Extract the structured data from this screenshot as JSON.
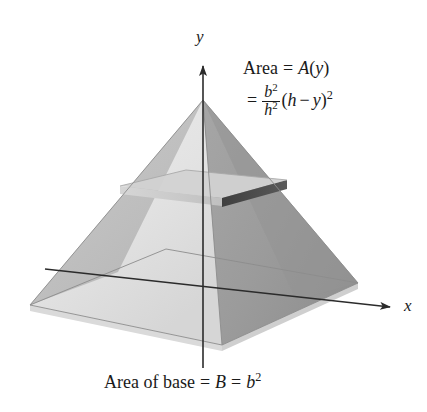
{
  "figure": {
    "axes": {
      "y_label": "y",
      "x_label": "x"
    },
    "annotation": {
      "line1_prefix": "Area",
      "line1_equals": "=",
      "line1_func_name": "A",
      "line1_open": "(",
      "line1_arg": "y",
      "line1_close": ")",
      "line2_equals": "=",
      "frac_numerator_base": "b",
      "frac_numerator_exp": "2",
      "frac_denominator_base": "h",
      "frac_denominator_exp": "2",
      "line2_open": "(",
      "line2_var_h": "h",
      "line2_minus": "−",
      "line2_var_y": "y",
      "line2_close": ")",
      "line2_exp": "2",
      "plain_line1": "Area = A(y)",
      "plain_line2": "= b²/h² (h − y)²"
    },
    "caption": {
      "text_prefix": "Area of base",
      "equals_1": "=",
      "symbol_B": "B",
      "equals_2": "=",
      "symbol_b": "b",
      "exponent": "2",
      "plain": "Area of base = B = b²"
    },
    "colors": {
      "face_front_left": "#e2e2e2",
      "face_left": "#b9b9b9",
      "face_right": "#9d9d9d",
      "face_right_dark": "#8d8d8d",
      "base_front": "#ededed",
      "base_left": "#e6e6e6",
      "slab_top": "#cfcfcf",
      "slab_edge_dark": "#4a4a4a",
      "slab_edge_light": "#c4c4c4",
      "axis": "#2b2b2b",
      "text": "#1a1a1a",
      "background": "#ffffff"
    },
    "geometry": {
      "apex": [
        203,
        100
      ],
      "base_left": [
        30,
        305
      ],
      "base_right": [
        358,
        283
      ],
      "base_front": [
        222,
        345
      ],
      "base_back": [
        166,
        249
      ],
      "slab_left": [
        120,
        186
      ],
      "slab_right": [
        287,
        180
      ],
      "y_axis_top": [
        203,
        62
      ],
      "y_axis_bottom": [
        203,
        368
      ],
      "x_axis_start": [
        45,
        269
      ],
      "x_axis_end": [
        392,
        308
      ]
    }
  }
}
